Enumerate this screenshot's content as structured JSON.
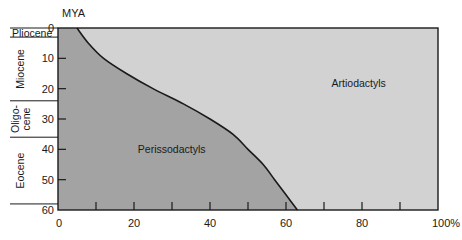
{
  "chart_data": {
    "type": "area",
    "title": "",
    "xlabel": "",
    "ylabel": "MYA",
    "x_unit": "%",
    "xlim": [
      0,
      100
    ],
    "ylim": [
      0,
      60
    ],
    "y_inverted": true,
    "x_ticks": [
      0,
      20,
      40,
      60,
      80,
      100
    ],
    "x_tick_labels": [
      "0",
      "20",
      "40",
      "60",
      "80",
      "100%"
    ],
    "x_minor_ticks": [
      10,
      30,
      50,
      70,
      90
    ],
    "y_ticks": [
      0,
      10,
      20,
      30,
      40,
      50,
      60
    ],
    "y_tick_labels": [
      "0",
      "10",
      "20",
      "30",
      "40",
      "50",
      "60"
    ],
    "grid": false,
    "legend": "none",
    "epochs": [
      {
        "name": "Pliocene",
        "from": 0,
        "to": 3,
        "lines": [
          "Pliocene"
        ]
      },
      {
        "name": "Miocene",
        "from": 3,
        "to": 24,
        "lines": [
          "Miocene"
        ]
      },
      {
        "name": "Oligocene",
        "from": 24,
        "to": 36,
        "lines": [
          "Oligo-",
          "cene"
        ]
      },
      {
        "name": "Eocene",
        "from": 36,
        "to": 58,
        "lines": [
          "Eocene"
        ]
      }
    ],
    "series": [
      {
        "name": "Perissodactyls",
        "color": "#a3a3a3",
        "mya": [
          0,
          5,
          10,
          15,
          20,
          25,
          30,
          35,
          40,
          45,
          50,
          55,
          60
        ],
        "percent": [
          5,
          8,
          12,
          18,
          25,
          33,
          40,
          46,
          50,
          54,
          57,
          60,
          63
        ]
      },
      {
        "name": "Artiodactyls",
        "color": "#d2d2d2",
        "mya": [
          0,
          5,
          10,
          15,
          20,
          25,
          30,
          35,
          40,
          45,
          50,
          55,
          60
        ],
        "percent": [
          95,
          92,
          88,
          82,
          75,
          67,
          60,
          54,
          50,
          46,
          43,
          40,
          37
        ]
      }
    ],
    "annotations": [
      {
        "text": "Perissodactyls",
        "x_pct": 21,
        "mya": 40
      },
      {
        "text": "Artiodactyls",
        "x_pct": 72,
        "mya": 18
      }
    ]
  },
  "labels": {
    "y_unit": "MYA",
    "perisso": "Perissodactyls",
    "artio": "Artiodactyls"
  }
}
